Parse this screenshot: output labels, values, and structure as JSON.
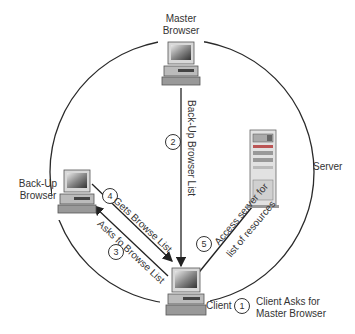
{
  "diagram": {
    "type": "network-browsing-flow",
    "nodes": [
      {
        "id": "master",
        "label_line1": "Master",
        "label_line2": "Browser",
        "icon": "desktop-computer-icon"
      },
      {
        "id": "backup",
        "label_line1": "Back-Up",
        "label_line2": "Browser",
        "icon": "desktop-computer-icon"
      },
      {
        "id": "client",
        "label": "Client",
        "icon": "desktop-computer-icon"
      },
      {
        "id": "server",
        "label": "Server",
        "icon": "tower-server-icon"
      }
    ],
    "steps": [
      {
        "number": "1",
        "text_line1": "Client Asks for",
        "text_line2": "Master Browser"
      },
      {
        "number": "2",
        "text": "Back-Up Browser List",
        "from": "master",
        "to": "client"
      },
      {
        "number": "3",
        "text": "Asks fo Browse List",
        "from": "client",
        "to": "backup"
      },
      {
        "number": "4",
        "text": "Gets Browse List",
        "from": "backup",
        "to": "client"
      },
      {
        "number": "5",
        "text_line1": "Access server for",
        "text_line2": "list of resources",
        "from": "client",
        "to": "server"
      }
    ],
    "colors": {
      "line": "#2a2a2a",
      "text": "#333333",
      "background": "#ffffff"
    }
  }
}
